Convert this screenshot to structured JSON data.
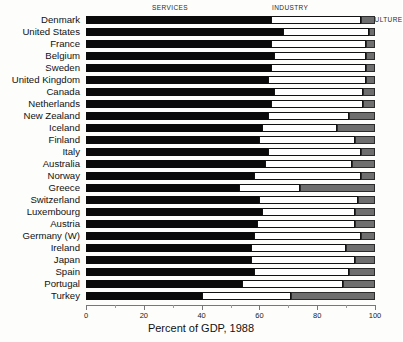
{
  "legend": {
    "services": "SERVICES",
    "industry": "INDUSTRY",
    "agriculture": "AGRICULTURE"
  },
  "axis": {
    "title": "Percent of GDP, 1988",
    "ticks": [
      "0",
      "20",
      "40",
      "60",
      "80",
      "100"
    ]
  },
  "colors": {
    "services": "#0a0a0a",
    "industry": "#ffffff",
    "agriculture": "#6e6e6e",
    "axis": "#777777",
    "text": "#111111"
  },
  "chart_data": {
    "type": "bar",
    "orientation": "horizontal",
    "stacked": true,
    "title": "",
    "xlabel": "Percent of GDP, 1988",
    "ylabel": "",
    "xlim": [
      0,
      100
    ],
    "xticks": [
      0,
      20,
      40,
      60,
      80,
      100
    ],
    "grid": false,
    "legend_position": "top",
    "categories": [
      "Denmark",
      "United States",
      "France",
      "Belgium",
      "Sweden",
      "United Kingdom",
      "Canada",
      "Netherlands",
      "New Zealand",
      "Iceland",
      "Finland",
      "Italy",
      "Australia",
      "Norway",
      "Greece",
      "Switzerland",
      "Luxembourg",
      "Austria",
      "Germany (W)",
      "Ireland",
      "Japan",
      "Spain",
      "Portugal",
      "Turkey"
    ],
    "series": [
      {
        "name": "SERVICES",
        "color": "#0a0a0a",
        "values": [
          64,
          68,
          64,
          65,
          64,
          63,
          65,
          64,
          63,
          61,
          60,
          63,
          62,
          58,
          53,
          60,
          61,
          59,
          58,
          57,
          57,
          58,
          54,
          40
        ]
      },
      {
        "name": "INDUSTRY",
        "color": "#ffffff",
        "values": [
          31,
          30,
          33,
          32,
          33,
          34,
          31,
          32,
          28,
          26,
          33,
          32,
          30,
          37,
          21,
          34,
          32,
          34,
          37,
          33,
          36,
          33,
          35,
          31
        ]
      },
      {
        "name": "AGRICULTURE",
        "color": "#6e6e6e",
        "values": [
          5,
          2,
          3,
          3,
          3,
          3,
          4,
          4,
          9,
          13,
          7,
          5,
          8,
          5,
          26,
          6,
          7,
          7,
          5,
          10,
          7,
          9,
          11,
          29
        ]
      }
    ]
  }
}
